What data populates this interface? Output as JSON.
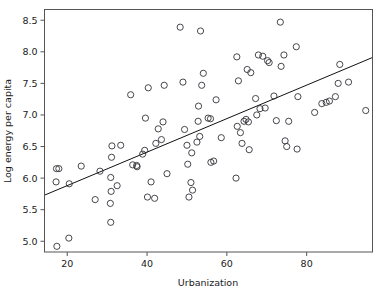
{
  "chart_data": {
    "type": "scatter",
    "title": "",
    "xlabel": "Urbanization",
    "ylabel": "Log energy per capita",
    "xlim": [
      14.3,
      96.5
    ],
    "ylim": [
      4.83,
      8.67
    ],
    "xticks": [
      20,
      40,
      60,
      80
    ],
    "xticklabels": [
      "20",
      "40",
      "60",
      "80"
    ],
    "yticks": [
      5.0,
      5.5,
      6.0,
      6.5,
      7.0,
      7.5,
      8.0,
      8.5
    ],
    "yticklabels": [
      "5.0",
      "5.5",
      "6.0",
      "6.5",
      "7.0",
      "7.5",
      "8.0",
      "8.5"
    ],
    "grid": false,
    "legend": null,
    "marker": "open-circle",
    "marker_size": 3.1,
    "marker_color": "#33333a",
    "points": [
      [
        17.4,
        4.92
      ],
      [
        20.4,
        5.05
      ],
      [
        17.2,
        5.94
      ],
      [
        20.5,
        5.91
      ],
      [
        17.3,
        6.15
      ],
      [
        17.9,
        6.15
      ],
      [
        23.5,
        6.19
      ],
      [
        27.0,
        5.66
      ],
      [
        28.2,
        6.11
      ],
      [
        30.9,
        5.3
      ],
      [
        30.8,
        5.6
      ],
      [
        30.9,
        6.01
      ],
      [
        31.0,
        5.79
      ],
      [
        31.1,
        6.33
      ],
      [
        31.2,
        6.51
      ],
      [
        32.5,
        5.88
      ],
      [
        33.4,
        6.52
      ],
      [
        35.9,
        7.32
      ],
      [
        36.4,
        6.21
      ],
      [
        37.4,
        6.2
      ],
      [
        37.5,
        6.18
      ],
      [
        38.9,
        6.38
      ],
      [
        39.4,
        6.44
      ],
      [
        39.6,
        6.95
      ],
      [
        40.1,
        5.7
      ],
      [
        40.3,
        7.43
      ],
      [
        41.0,
        5.94
      ],
      [
        41.9,
        5.68
      ],
      [
        42.2,
        6.55
      ],
      [
        42.8,
        6.78
      ],
      [
        43.6,
        6.61
      ],
      [
        44.0,
        6.89
      ],
      [
        44.3,
        7.47
      ],
      [
        45.0,
        6.07
      ],
      [
        48.3,
        8.39
      ],
      [
        49.0,
        7.52
      ],
      [
        49.4,
        6.77
      ],
      [
        50.0,
        6.52
      ],
      [
        50.2,
        6.22
      ],
      [
        50.5,
        5.7
      ],
      [
        51.0,
        5.93
      ],
      [
        51.2,
        6.4
      ],
      [
        51.4,
        5.81
      ],
      [
        52.5,
        6.57
      ],
      [
        52.8,
        6.9
      ],
      [
        52.9,
        7.14
      ],
      [
        53.2,
        6.66
      ],
      [
        53.4,
        8.33
      ],
      [
        53.7,
        7.47
      ],
      [
        54.1,
        7.66
      ],
      [
        55.3,
        6.95
      ],
      [
        55.9,
        6.94
      ],
      [
        56.0,
        6.25
      ],
      [
        56.7,
        6.27
      ],
      [
        57.3,
        7.24
      ],
      [
        58.6,
        6.64
      ],
      [
        62.3,
        6.0
      ],
      [
        62.5,
        7.92
      ],
      [
        62.6,
        6.82
      ],
      [
        62.9,
        7.54
      ],
      [
        63.4,
        6.72
      ],
      [
        63.8,
        6.55
      ],
      [
        64.3,
        6.9
      ],
      [
        64.8,
        6.93
      ],
      [
        65.1,
        7.72
      ],
      [
        65.4,
        6.89
      ],
      [
        65.6,
        6.45
      ],
      [
        66.0,
        7.67
      ],
      [
        67.2,
        7.26
      ],
      [
        67.5,
        7.0
      ],
      [
        67.9,
        7.95
      ],
      [
        68.3,
        7.1
      ],
      [
        69.0,
        7.93
      ],
      [
        69.6,
        7.11
      ],
      [
        70.2,
        7.86
      ],
      [
        70.6,
        7.83
      ],
      [
        71.8,
        7.3
      ],
      [
        72.4,
        6.91
      ],
      [
        73.4,
        8.47
      ],
      [
        73.6,
        7.77
      ],
      [
        74.3,
        7.95
      ],
      [
        74.6,
        6.59
      ],
      [
        75.0,
        6.5
      ],
      [
        75.5,
        6.9
      ],
      [
        77.4,
        8.08
      ],
      [
        77.6,
        6.46
      ],
      [
        77.8,
        7.29
      ],
      [
        82.0,
        7.04
      ],
      [
        83.8,
        7.18
      ],
      [
        84.9,
        7.2
      ],
      [
        85.7,
        7.22
      ],
      [
        87.2,
        7.29
      ],
      [
        87.9,
        7.5
      ],
      [
        88.3,
        7.8
      ],
      [
        90.5,
        7.52
      ],
      [
        94.8,
        7.07
      ]
    ],
    "fit_line": {
      "label": "linear fit",
      "x_start": 14.3,
      "y_start": 5.73,
      "x_end": 96.5,
      "y_end": 7.91,
      "color": "#111111"
    }
  }
}
